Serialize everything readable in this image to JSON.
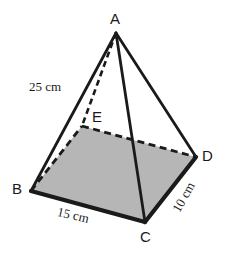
{
  "figure": {
    "name": "rectangular-pyramid-diagram",
    "type": "geometry-diagram",
    "background_color": "#ffffff",
    "stroke_color": "#1a1a1a",
    "base_fill_color": "#b6b6b6",
    "vertices": {
      "A": {
        "label": "A",
        "x": 116,
        "y": 33,
        "role": "apex"
      },
      "B": {
        "label": "B",
        "x": 31,
        "y": 191,
        "role": "base-front-left"
      },
      "C": {
        "label": "C",
        "x": 145,
        "y": 222,
        "role": "base-front-right"
      },
      "D": {
        "label": "D",
        "x": 196,
        "y": 157,
        "role": "base-back-right"
      },
      "E": {
        "label": "E",
        "x": 82,
        "y": 126,
        "role": "base-back-left-hidden"
      }
    },
    "edges": [
      {
        "name": "edge-AB",
        "from": "A",
        "to": "B",
        "style": "solid"
      },
      {
        "name": "edge-AC",
        "from": "A",
        "to": "C",
        "style": "solid"
      },
      {
        "name": "edge-AD",
        "from": "A",
        "to": "D",
        "style": "solid"
      },
      {
        "name": "edge-AE",
        "from": "A",
        "to": "E",
        "style": "dashed"
      },
      {
        "name": "edge-BC",
        "from": "B",
        "to": "C",
        "style": "solid-thick"
      },
      {
        "name": "edge-CD",
        "from": "C",
        "to": "D",
        "style": "solid-thick"
      },
      {
        "name": "edge-BE",
        "from": "B",
        "to": "E",
        "style": "dashed"
      },
      {
        "name": "edge-ED",
        "from": "E",
        "to": "D",
        "style": "dashed"
      }
    ],
    "measurements": {
      "slant_edge_ab": "25 cm",
      "base_edge_bc": "15 cm",
      "base_edge_cd": "10 cm"
    }
  }
}
